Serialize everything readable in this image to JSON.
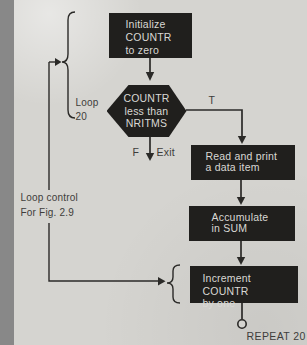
{
  "flowchart": {
    "title_context": "loop flowchart",
    "nodes": [
      {
        "id": "init",
        "shape": "rect",
        "lines": [
          "Initialize",
          "COUNTR",
          "to zero"
        ]
      },
      {
        "id": "test",
        "shape": "hexagon",
        "lines": [
          "COUNTR",
          "less than",
          "NRITMS"
        ]
      },
      {
        "id": "read",
        "shape": "rect",
        "lines": [
          "Read and print",
          "a data item"
        ]
      },
      {
        "id": "accumulate",
        "shape": "rect",
        "lines": [
          "Accumulate",
          "in SUM"
        ]
      },
      {
        "id": "increment",
        "shape": "rect",
        "lines": [
          "Increment COUNTR",
          "by one"
        ]
      }
    ],
    "labels": {
      "loop": "Loop",
      "loop_count": "20",
      "true_branch": "T",
      "false_branch": "F",
      "exit": "Exit",
      "loop_control_line1": "Loop control",
      "loop_control_line2": "For Fig. 2.9",
      "repeat": "REPEAT 20"
    },
    "colors": {
      "background": "#d5d4d0",
      "node_fill": "#201f1d",
      "node_text": "#d9d8d4",
      "line": "#2b2a28",
      "label_text": "#3e3d3b"
    }
  }
}
